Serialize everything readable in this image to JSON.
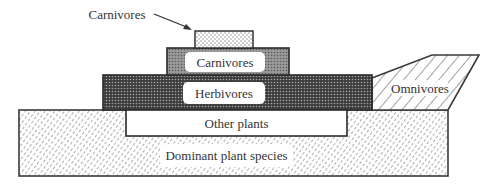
{
  "diagram": {
    "type": "trophic-structure",
    "callout": {
      "label": "Carnivores",
      "arrow": "points-to-top-carnivore-layer"
    },
    "layers": [
      {
        "id": "top-carnivores",
        "label": "",
        "pattern": "light-dots"
      },
      {
        "id": "carnivores",
        "label": "Carnivores",
        "pattern": "medium-dots"
      },
      {
        "id": "herbivores",
        "label": "Herbivores",
        "pattern": "dense-dark-dots"
      },
      {
        "id": "omnivores",
        "label": "Omnivores",
        "pattern": "diagonal-hatch"
      },
      {
        "id": "other-plants",
        "label": "Other plants",
        "pattern": "plain-white"
      },
      {
        "id": "dominant-plants",
        "label": "Dominant plant species",
        "pattern": "dashed-diagonal-hatch"
      }
    ]
  }
}
